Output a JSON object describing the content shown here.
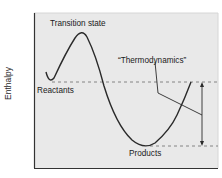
{
  "diagram": {
    "type": "energy-profile",
    "y_axis_label": "Enthalpy",
    "labels": {
      "transition_state": "Transition state",
      "reactants": "Reactants",
      "products": "Products",
      "thermodynamics": "“Thermodynamics”"
    },
    "colors": {
      "plot_background": "#e9e9e9",
      "curve": "#2a2a2a",
      "axis": "#333333",
      "dashed": "#6a6a6a"
    }
  }
}
